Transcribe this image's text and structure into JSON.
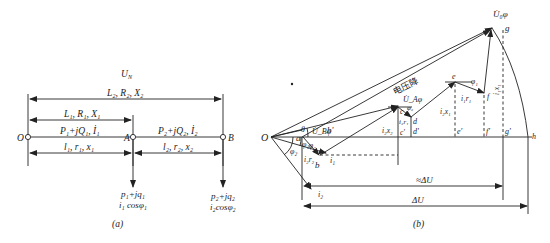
{
  "figure_a": {
    "caption": "(a)",
    "top_label": "U_N",
    "top_label_main": "U",
    "top_label_sub": "N",
    "span_total_label": "L₂, R₂, X₂",
    "span_1_label": "L₁, R₁, X₁",
    "flow_1_label": "P₁+jQ₁, İ₁",
    "flow_2_label": "P₂+jQ₂, İ₂",
    "segment_1_label": "l₁, r₁, x₁",
    "segment_2_label": "l₂, r₂, x₂",
    "node_O": "O",
    "node_A": "A",
    "node_B": "B",
    "load_A_power": "p₁+jq₁",
    "load_A_current": "i₁ cosφ₁",
    "load_B_power": "p₂+jq₂",
    "load_B_current": "i₂cosφ₂"
  },
  "figure_b": {
    "caption": "(b)",
    "origin": "O",
    "voltage_drop_label": "电压降",
    "U0_label": "U̇₀φ",
    "UA_label": "U̇_Aφ",
    "UB_label": "U̇_Bφ",
    "theta": "θ",
    "phi1": "φ₁",
    "phi2": "φ₂",
    "i1": "i₁",
    "i2": "i₂",
    "points": [
      "a",
      "b",
      "b'",
      "c",
      "c'",
      "d",
      "d'",
      "e",
      "e'",
      "f",
      "f'",
      "g",
      "g'",
      "h"
    ],
    "seg_i2r2": "i₂r₂",
    "seg_i2x2": "i₂x₂",
    "seg_i2r1": "i₂r₁",
    "seg_i2x1": "i₂x₁",
    "seg_i1r1": "i₁r₁",
    "seg_i1x1": "i₁x₁",
    "approx_drop": "≈ΔU",
    "exact_drop": "ΔU"
  }
}
